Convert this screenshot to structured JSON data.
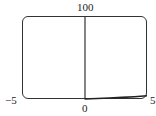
{
  "chart_data": {
    "type": "line",
    "title": "",
    "xlabel": "",
    "ylabel": "",
    "xlim": [
      -5,
      5
    ],
    "ylim": [
      0,
      100
    ],
    "tick_labels": {
      "x_min": "−5",
      "x_max": "5",
      "y_min": "0",
      "y_max": "100"
    },
    "grid": false,
    "legend": null,
    "series": [
      {
        "name": "curve",
        "x": [
          0,
          1,
          2,
          3,
          4,
          5
        ],
        "y": [
          0,
          0.6,
          1.2,
          1.9,
          2.8,
          3.8
        ]
      }
    ]
  },
  "labels": {
    "top": "100",
    "left": "−5",
    "right": "5",
    "bottom": "0"
  },
  "colors": {
    "axis": "#333333",
    "curve": "#222222"
  }
}
